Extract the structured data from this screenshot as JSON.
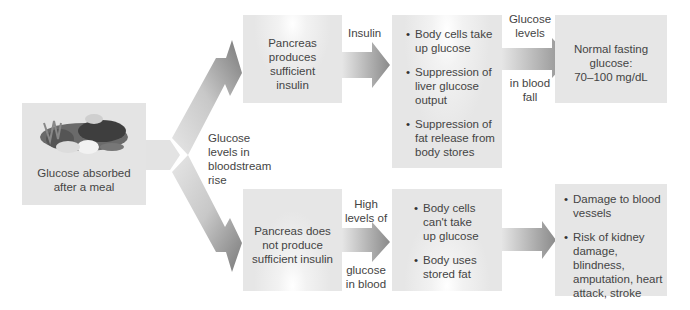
{
  "start": {
    "label_line1": "Glucose absorbed",
    "label_line2": "after a meal",
    "image": "meal-food-illustration"
  },
  "branch_label": {
    "lines": [
      "Glucose",
      "levels in",
      "bloodstream",
      "rise"
    ]
  },
  "top_path": {
    "pancreas": {
      "lines": [
        "Pancreas",
        "produces",
        "sufficient",
        "insulin"
      ]
    },
    "arrow1_label": "Insulin",
    "effects": [
      "Body cells take up glucose",
      "Suppression of liver glucose output",
      "Suppression of fat release from body stores"
    ],
    "effects_lines": [
      [
        "Body cells take",
        "up glucose"
      ],
      [
        "Suppression of",
        "liver glucose",
        "output"
      ],
      [
        "Suppression of",
        "fat release from",
        "body stores"
      ]
    ],
    "arrow2_label_top": [
      "Glucose",
      "levels"
    ],
    "arrow2_label_bottom": [
      "in blood",
      "fall"
    ],
    "outcome": {
      "lines": [
        "Normal fasting",
        "glucose:",
        "70–100 mg/dL"
      ]
    }
  },
  "bottom_path": {
    "pancreas": {
      "lines": [
        "Pancreas does",
        "not produce",
        "sufficient insulin"
      ]
    },
    "arrow1_label_top": [
      "High",
      "levels of"
    ],
    "arrow1_label_bottom": [
      "glucose",
      "in blood"
    ],
    "effects_lines": [
      [
        "Body cells",
        "can't take",
        "up glucose"
      ],
      [
        "Body uses",
        "stored fat"
      ]
    ],
    "outcome_lines": [
      [
        "Damage to blood",
        "vessels"
      ],
      [
        "Risk of kidney",
        "damage, blindness,",
        "amputation, heart",
        "attack, stroke"
      ]
    ]
  }
}
